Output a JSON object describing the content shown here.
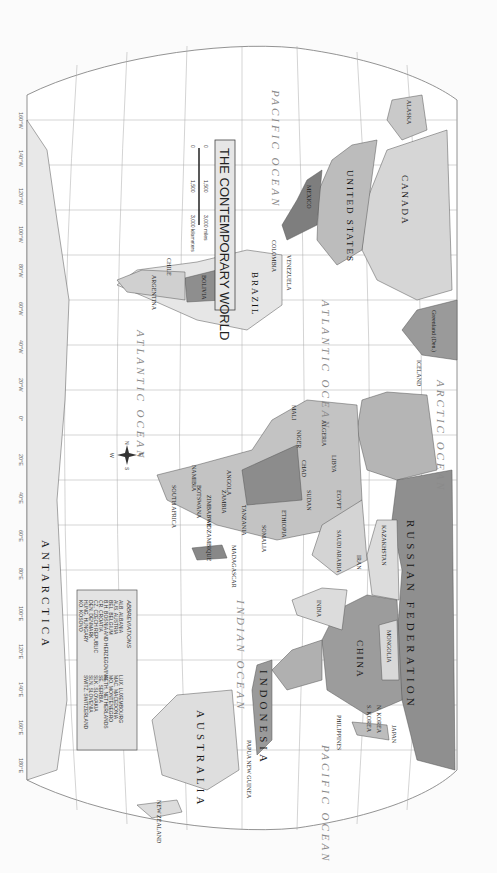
{
  "map": {
    "title": "THE CONTEMPORARY WORLD",
    "orientation": "rotated 90 degrees clockwise (north to the left)",
    "colors": {
      "ocean": "#ffffff",
      "land_light": "#e2e2e2",
      "land_mid": "#bdbdbd",
      "land_dark": "#8f8f8f",
      "graticule": "#9a9a9a",
      "border": "#555555"
    },
    "oceans": [
      {
        "id": "pacific-ocean-west",
        "label": "PACIFIC OCEAN"
      },
      {
        "id": "pacific-ocean-east",
        "label": "PACIFIC OCEAN"
      },
      {
        "id": "atlantic-ocean-north",
        "label": "ATLANTIC OCEAN"
      },
      {
        "id": "atlantic-ocean-south",
        "label": "ATLANTIC OCEAN"
      },
      {
        "id": "arctic-ocean",
        "label": "ARCTIC OCEAN"
      },
      {
        "id": "indian-ocean",
        "label": "INDIAN OCEAN"
      }
    ],
    "continents": {
      "antarctica": "ANTARCTICA",
      "australia": "AUSTRALIA",
      "indonesia": "INDONESIA"
    },
    "major_countries": {
      "russia": "RUSSIAN FEDERATION",
      "canada": "CANADA",
      "united_states": "UNITED STATES",
      "china": "CHINA",
      "brazil": "BRAZIL",
      "kazakhstan": "KAZAKHSTAN",
      "mongolia": "MONGOLIA",
      "india": "INDIA",
      "algeria": "ALGERIA",
      "libya": "LIBYA",
      "egypt": "EGYPT",
      "sudan": "SUDAN",
      "chad": "CHAD",
      "niger": "NIGER",
      "mali": "MALI",
      "mexico": "MEXICO",
      "argentina": "ARGENTINA",
      "chile": "CHILE",
      "peru": "PERU",
      "bolivia": "BOLIVIA",
      "colombia": "COLOMBIA",
      "venezuela": "VENEZUELA",
      "saudi_arabia": "SAUDI ARABIA",
      "iran": "IRAN",
      "ethiopia": "ETHIOPIA",
      "somalia": "SOMALIA",
      "angola": "ANGOLA",
      "zambia": "ZAMBIA",
      "tanzania": "TANZANIA",
      "mozambique": "MOZAMBIQUE",
      "madagascar": "MADAGASCAR",
      "namibia": "NAMIBIA",
      "botswana": "BOTSWANA",
      "zimbabwe": "ZIMBABWE",
      "south_africa": "SOUTH AFRICA",
      "new_zealand": "NEW ZEALAND",
      "papua_new_guinea": "PAPUA NEW GUINEA",
      "japan": "JAPAN",
      "n_korea": "N. KOREA",
      "s_korea": "S. KOREA",
      "philippines": "PHILIPPINES",
      "greenland": "Greenland (Den.)",
      "iceland": "ICELAND",
      "alaska": "ALASKA"
    },
    "minor_labels": [
      "UNITED KINGDOM",
      "IRELAND",
      "PORTUGAL",
      "MOROCCO",
      "TUNISIA",
      "SPAIN",
      "FRANCE",
      "NORWAY",
      "SWEDEN",
      "FINLAND",
      "ESTONIA",
      "LATVIA",
      "LITHUANIA",
      "BELARUS",
      "UKRAINE",
      "POLAND",
      "GERMANY",
      "ITALY",
      "ROMANIA",
      "TURKEY",
      "SYRIA",
      "IRAQ",
      "JORDAN",
      "KUWAIT",
      "QATAR",
      "OMAN",
      "UNITED ARAB EMIRATES",
      "YEMEN",
      "DJIBOUTI",
      "ERITREA",
      "AFGHANISTAN",
      "PAKISTAN",
      "UZBEKISTAN",
      "TURKMENISTAN",
      "KYRGYZSTAN",
      "TAJIKISTAN",
      "NEPAL",
      "BHUTAN",
      "BANGLADESH",
      "MYANMAR (BURMA)",
      "LAOS",
      "THAILAND",
      "CAMBODIA",
      "VIETNAM",
      "MALAYSIA",
      "BRUNEI",
      "SINGAPORE",
      "SRI LANKA",
      "MALDIVES",
      "Taiwan",
      "TIMOR LESTE",
      "PALAU",
      "Mariana Is. (U.S.)",
      "Guam (U.S.)",
      "FEDERATED STATES OF MICRONESIA",
      "MARSHALL IS.",
      "NAURU",
      "KIRIBATI",
      "TUVALU",
      "SOLOMON IS.",
      "VANUATU",
      "FIJI",
      "New Caledonia (Fr.)",
      "Tasmania (AUST.)",
      "SAMOA",
      "TONGA",
      "Hawaii",
      "Easter I. (Chile)",
      "Galápagos Is. (Ec.)",
      "ECUADOR",
      "PANAMA",
      "COSTA RICA",
      "HONDURAS",
      "EL SALVADOR",
      "GUATEMALA",
      "BELIZE",
      "CUBA",
      "HAITI",
      "BAHAMAS",
      "DOMINICAN REPUBLIC",
      "Puerto Rico (U.S.)",
      "JAMAICA",
      "ST. KITTS AND NEVIS",
      "ANTIGUA AND BARBUDA",
      "DOMINICA",
      "ST. LUCIA",
      "BARBADOS",
      "ST. VINCENT & THE GRENADINES",
      "GRENADA",
      "TRINIDAD AND TOBAGO",
      "GUYANA",
      "SURINAME",
      "French Guiana (Fr.)",
      "URUGUAY",
      "PARAGUAY",
      "Falkland Is. (U.K.)",
      "Azores (Port.)",
      "Canary Is. (Sp.)",
      "Western Sahara (Mor.)",
      "MAURITANIA",
      "CAPE VERDE",
      "SENEGAL",
      "GAMBIA",
      "GUINEA-BISSAU",
      "GUINEA",
      "SIERRA LEONE",
      "LIBERIA",
      "CÔTE D'IVOIRE",
      "BURKINA FASO",
      "GHANA",
      "TOGO",
      "BENIN",
      "NIGERIA",
      "CAMEROON",
      "EQ. GUINEA",
      "GABON",
      "SÃO TOMÉ & PRÍNCIPE",
      "CENTRAL AFRICAN REP.",
      "DEM. REP. OF THE CONGO",
      "CONGO",
      "RWANDA",
      "BURUNDI",
      "UGANDA",
      "KENYA",
      "SOUTH SUDAN",
      "MALAWI",
      "SEYCHELLES",
      "COMOROS",
      "MAURITIUS",
      "SWAZILAND",
      "LESOTHO",
      "Equator"
    ],
    "abbreviations": {
      "heading": "ABBREVIATIONS",
      "entries": [
        {
          "abbr": "ALB.",
          "name": "ALBANIA"
        },
        {
          "abbr": "AUS.",
          "name": "AUSTRIA"
        },
        {
          "abbr": "BEL.",
          "name": "BELGIUM"
        },
        {
          "abbr": "B.H.",
          "name": "BOSNIA AND HERZEGOVINA"
        },
        {
          "abbr": "CR.",
          "name": "CROATIA"
        },
        {
          "abbr": "CZ.",
          "name": "CZECH REPUBLIC"
        },
        {
          "abbr": "DEN.",
          "name": "DENMARK"
        },
        {
          "abbr": "HUNG.",
          "name": "HUNGARY"
        },
        {
          "abbr": "KO.",
          "name": "KOSOVO"
        },
        {
          "abbr": "LUX.",
          "name": "LUXEMBOURG"
        },
        {
          "abbr": "MAC.",
          "name": "MACEDONIA"
        },
        {
          "abbr": "MO.",
          "name": "MONTENEGRO"
        },
        {
          "abbr": "NETH.",
          "name": "NETHERLANDS"
        },
        {
          "abbr": "SE.",
          "name": "SERBIA"
        },
        {
          "abbr": "SLK.",
          "name": "SLOVAKIA"
        },
        {
          "abbr": "SLN.",
          "name": "SLOVENIA"
        },
        {
          "abbr": "SWITZ.",
          "name": "SWITZERLAND"
        }
      ]
    },
    "scale": {
      "miles": [
        "0",
        "1,500",
        "3,000 miles"
      ],
      "kilometers": [
        "0",
        "1,500",
        "3,000 kilometers"
      ]
    },
    "compass": {
      "n": "N",
      "s": "S",
      "e": "E",
      "w": "W"
    },
    "longitude_labels": [
      "160°W",
      "140°W",
      "120°W",
      "100°W",
      "80°W",
      "60°W",
      "40°W",
      "20°W",
      "0°",
      "20°E",
      "40°E",
      "60°E",
      "80°E",
      "100°E",
      "120°E",
      "140°E",
      "160°E",
      "180°E"
    ],
    "latitude_labels": [
      "80°N",
      "60°N",
      "40°N",
      "20°N",
      "0°",
      "20°S",
      "40°S",
      "60°S",
      "80°S"
    ]
  }
}
